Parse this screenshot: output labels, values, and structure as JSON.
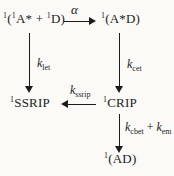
{
  "page": {
    "background": "#fbfaf7",
    "ink": "#1c1c1c"
  },
  "states": {
    "encounter": {
      "sup_outer": "1",
      "open": "(",
      "sup_a": "1",
      "a": "A* + ",
      "sup_d": "1",
      "d": "D)"
    },
    "exciplex": {
      "sup": "1",
      "text": "(A*D)"
    },
    "ssrip": {
      "sup": "1",
      "text": "SSRIP"
    },
    "crip": {
      "sup": "1",
      "text": "CRIP"
    },
    "ground": {
      "sup": "1",
      "text": "(AD)"
    }
  },
  "rates": {
    "alpha": "α",
    "let": {
      "k": "k",
      "sub": "let"
    },
    "cet": {
      "k": "k",
      "sub": "cet"
    },
    "ssrip": {
      "k": "k",
      "sub": "ssrip"
    },
    "cbet": {
      "k": "k",
      "sub": "cbet"
    },
    "cbet_plus": " + ",
    "em": {
      "k": "k",
      "sub": "em"
    }
  }
}
